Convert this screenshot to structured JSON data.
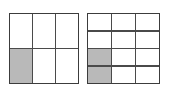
{
  "figure": {
    "background_color": "#ffffff",
    "line_color": "#3c3c3c",
    "shaded_color": "#b9b9b9",
    "unshaded_color": "#ffffff"
  },
  "grids": [
    {
      "name": "left-grid",
      "columns": 3,
      "rows": 2,
      "total_cells": 6,
      "shaded_count": 1,
      "fraction": "1/6",
      "cells": [
        {
          "row": 1,
          "col": 1,
          "shaded": false
        },
        {
          "row": 1,
          "col": 2,
          "shaded": false
        },
        {
          "row": 1,
          "col": 3,
          "shaded": false
        },
        {
          "row": 2,
          "col": 1,
          "shaded": true
        },
        {
          "row": 2,
          "col": 2,
          "shaded": false
        },
        {
          "row": 2,
          "col": 3,
          "shaded": false
        }
      ]
    },
    {
      "name": "right-grid",
      "columns": 3,
      "rows": 4,
      "total_cells": 12,
      "shaded_count": 2,
      "fraction": "2/12",
      "cells": [
        {
          "row": 1,
          "col": 1,
          "shaded": false
        },
        {
          "row": 1,
          "col": 2,
          "shaded": false
        },
        {
          "row": 1,
          "col": 3,
          "shaded": false
        },
        {
          "row": 2,
          "col": 1,
          "shaded": false
        },
        {
          "row": 2,
          "col": 2,
          "shaded": false
        },
        {
          "row": 2,
          "col": 3,
          "shaded": false
        },
        {
          "row": 3,
          "col": 1,
          "shaded": true
        },
        {
          "row": 3,
          "col": 2,
          "shaded": false
        },
        {
          "row": 3,
          "col": 3,
          "shaded": false
        },
        {
          "row": 4,
          "col": 1,
          "shaded": true
        },
        {
          "row": 4,
          "col": 2,
          "shaded": false
        },
        {
          "row": 4,
          "col": 3,
          "shaded": false
        }
      ]
    }
  ]
}
